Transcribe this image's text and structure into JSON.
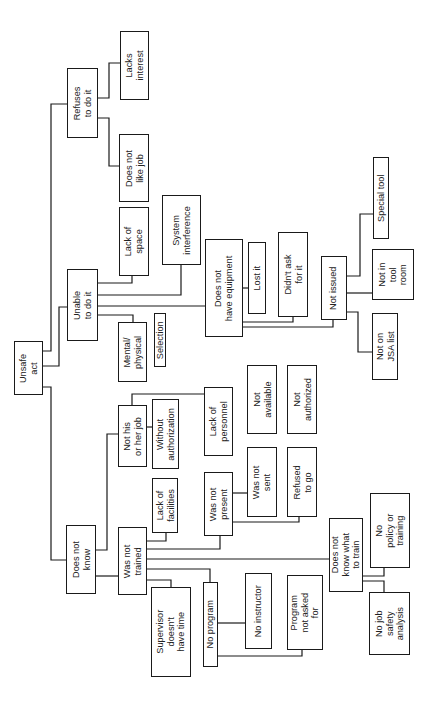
{
  "diagram": {
    "type": "fault-tree",
    "orientation": "rotated 90deg counter-clockwise (root at left, branches extend right)",
    "root": "Unsafe act",
    "colors": {
      "line": "#1a1a1a",
      "text": "#222222",
      "background": "#ffffff"
    }
  },
  "nodes": {
    "unsafe_act": "Unsafe\nact",
    "refuses": "Refuses\nto do it",
    "lacks_interest": "Lacks\ninterest",
    "not_like_job": "Does not\nlike job",
    "unable": "Unable\nto do it",
    "lack_space": "Lack of\nspace",
    "system_interference": "System\ninterference",
    "no_equipment": "Does not\nhave equipment",
    "lost_it": "Lost it",
    "didnt_ask": "Didn't ask\nfor it",
    "not_issued": "Not issued",
    "special_tool": "Special tool",
    "not_tool_room": "Not in\ntool\nroom",
    "not_jsa": "Not on\nJSA list",
    "mental_physical": "Mental/\nphysical",
    "selection": "Selection",
    "does_not_know": "Does not\nknow",
    "not_his_job": "Not his\nor her job",
    "without_auth": "Without\nauthorization",
    "lack_personnel": "Lack of\npersonnel",
    "not_available": "Not\navailable",
    "not_authorized": "Not\nauthorized",
    "was_not_trained": "Was not\ntrained",
    "lack_facilities": "Lack of\nfacilities",
    "was_not_present": "Was not\npresent",
    "was_not_sent": "Was not\nsent",
    "refused_to_go": "Refused\nto go",
    "supervisor_time": "Supervisor\ndoesn't\nhave time",
    "no_program": "No program",
    "no_instructor": "No instructor",
    "program_not_asked": "Program\nnot asked\nfor",
    "not_know_what": "Does not\nknow what\nto train",
    "no_policy": "No\npolicy or\ntraining",
    "no_jsa": "No job\nsafety\nanalysis"
  },
  "edges": [
    [
      "unsafe_act",
      "refuses"
    ],
    [
      "unsafe_act",
      "unable"
    ],
    [
      "unsafe_act",
      "does_not_know"
    ],
    [
      "refuses",
      "lacks_interest"
    ],
    [
      "refuses",
      "not_like_job"
    ],
    [
      "unable",
      "lack_space"
    ],
    [
      "unable",
      "system_interference"
    ],
    [
      "unable",
      "no_equipment"
    ],
    [
      "unable",
      "mental_physical"
    ],
    [
      "no_equipment",
      "lost_it"
    ],
    [
      "no_equipment",
      "didnt_ask"
    ],
    [
      "no_equipment",
      "not_issued"
    ],
    [
      "not_issued",
      "special_tool"
    ],
    [
      "not_issued",
      "not_tool_room"
    ],
    [
      "not_issued",
      "not_jsa"
    ],
    [
      "does_not_know",
      "not_his_job"
    ],
    [
      "does_not_know",
      "was_not_trained"
    ],
    [
      "not_his_job",
      "without_auth"
    ],
    [
      "not_his_job",
      "lack_personnel"
    ],
    [
      "was_not_trained",
      "lack_facilities"
    ],
    [
      "was_not_trained",
      "was_not_present"
    ],
    [
      "was_not_trained",
      "not_know_what"
    ],
    [
      "was_not_trained",
      "no_program"
    ],
    [
      "was_not_trained",
      "supervisor_time"
    ],
    [
      "was_not_present",
      "was_not_sent"
    ],
    [
      "was_not_present",
      "refused_to_go"
    ],
    [
      "no_program",
      "no_instructor"
    ],
    [
      "no_program",
      "program_not_asked"
    ],
    [
      "not_know_what",
      "no_policy"
    ],
    [
      "not_know_what",
      "no_jsa"
    ]
  ]
}
